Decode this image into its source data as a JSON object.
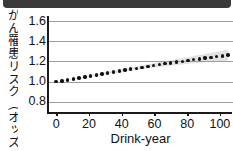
{
  "header": {
    "bar_color": "#3a3a3a"
  },
  "axes": {
    "ylabel": "がん罹患リスク（オッズ比）",
    "xlabel": "Drink-year",
    "yticks": [
      "1.6",
      "1.4",
      "1.2",
      "1.0",
      "0.8"
    ],
    "xticks": [
      "0",
      "20",
      "40",
      "60",
      "80",
      "100"
    ]
  },
  "colors": {
    "marker": "#111111",
    "gridline": "#9d9d9d",
    "axis": "#1a1a1a",
    "band": "#c9c9c9",
    "text": "#111111"
  },
  "chart_data": {
    "type": "scatter",
    "title": "",
    "xlabel": "Drink-year",
    "ylabel": "がん罹患リスク（オッズ比）",
    "xlim": [
      -5,
      108
    ],
    "ylim": [
      0.7,
      1.65
    ],
    "ytick_values": [
      1.6,
      1.4,
      1.2,
      1.0,
      0.8
    ],
    "xtick_values": [
      0,
      20,
      40,
      60,
      80,
      100
    ],
    "grid": "horizontal",
    "legend": "none",
    "series": [
      {
        "name": "がん罹患リスク（オッズ比）",
        "marker": "dot",
        "x": [
          0,
          3.5,
          7,
          10.5,
          14,
          17.5,
          21,
          24.5,
          28,
          31.5,
          35,
          38.5,
          42,
          45.5,
          49,
          52.5,
          56,
          59.5,
          63,
          66.5,
          70,
          73.5,
          77,
          80.5,
          84,
          87.5,
          91,
          94.5,
          98,
          101.5,
          105
        ],
        "y": [
          1.0,
          1.007,
          1.016,
          1.026,
          1.036,
          1.046,
          1.056,
          1.066,
          1.077,
          1.087,
          1.097,
          1.106,
          1.115,
          1.124,
          1.133,
          1.142,
          1.152,
          1.161,
          1.17,
          1.178,
          1.186,
          1.194,
          1.202,
          1.21,
          1.218,
          1.226,
          1.233,
          1.24,
          1.248,
          1.256,
          1.265
        ]
      }
    ],
    "confidence_band": {
      "description": "faint grey widening band around fitted points",
      "lower": [
        1.0,
        1.005,
        1.012,
        1.021,
        1.03,
        1.039,
        1.048,
        1.057,
        1.066,
        1.075,
        1.084,
        1.092,
        1.1,
        1.108,
        1.116,
        1.124,
        1.132,
        1.139,
        1.146,
        1.153,
        1.159,
        1.165,
        1.171,
        1.177,
        1.182,
        1.187,
        1.192,
        1.196,
        1.2,
        1.205,
        1.21
      ],
      "upper": [
        1.0,
        1.009,
        1.02,
        1.031,
        1.042,
        1.053,
        1.064,
        1.075,
        1.088,
        1.099,
        1.11,
        1.12,
        1.13,
        1.14,
        1.15,
        1.16,
        1.172,
        1.183,
        1.194,
        1.203,
        1.213,
        1.223,
        1.233,
        1.243,
        1.254,
        1.265,
        1.274,
        1.284,
        1.296,
        1.307,
        1.32
      ]
    }
  }
}
